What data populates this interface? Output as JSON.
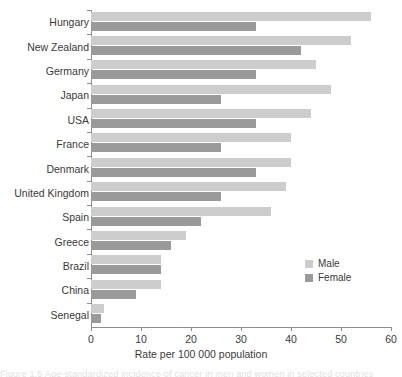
{
  "chart_data": {
    "type": "bar",
    "orientation": "horizontal",
    "title": "",
    "xlabel": "Rate per 100 000 population",
    "ylabel": "",
    "xlim": [
      0,
      60
    ],
    "xticks": [
      0,
      10,
      20,
      30,
      40,
      50,
      60
    ],
    "grid": false,
    "legend_position": "right-inside-lower",
    "categories": [
      "Hungary",
      "New Zealand",
      "Germany",
      "Japan",
      "USA",
      "France",
      "Denmark",
      "United Kingdom",
      "Spain",
      "Greece",
      "Brazil",
      "China",
      "Senegal"
    ],
    "series": [
      {
        "name": "Male",
        "color": "#cdcdcd",
        "values": [
          56,
          52,
          45,
          48,
          44,
          40,
          40,
          39,
          36,
          19,
          14,
          14,
          2.5
        ]
      },
      {
        "name": "Female",
        "color": "#9a9a9a",
        "values": [
          33,
          42,
          33,
          26,
          33,
          26,
          33,
          26,
          22,
          16,
          14,
          9,
          2
        ]
      }
    ]
  },
  "axis": {
    "x_tick_labels": [
      "0",
      "10",
      "20",
      "30",
      "40",
      "50",
      "60"
    ],
    "x_title": "Rate per 100 000 population"
  },
  "legend": {
    "items": [
      {
        "label": "Male",
        "color": "#cdcdcd"
      },
      {
        "label": "Female",
        "color": "#9a9a9a"
      }
    ]
  },
  "caption": {
    "cutoff_text": "Figure 1.5  Age-standardized incidence of cancer in men and women in selected countries"
  }
}
